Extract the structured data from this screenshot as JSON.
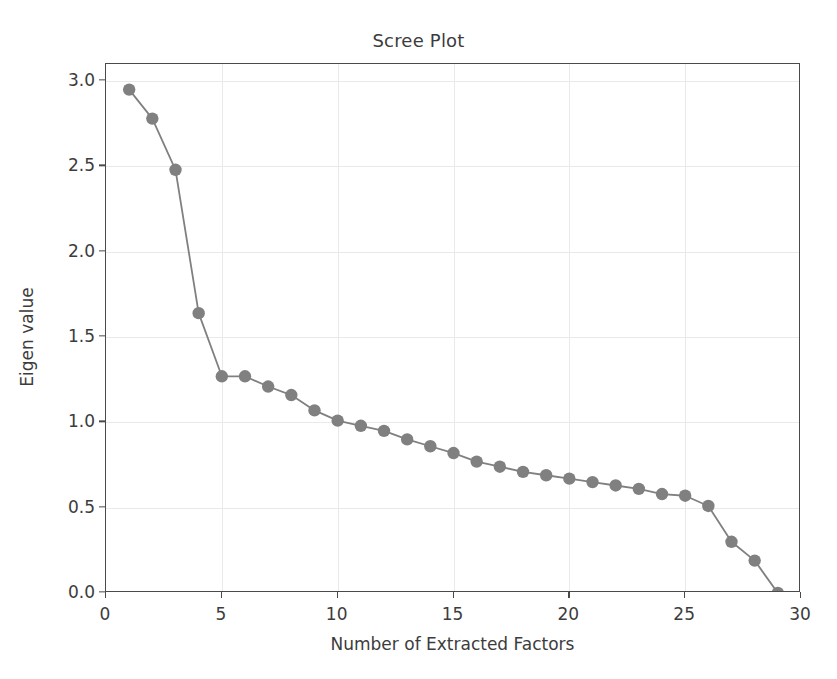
{
  "chart_data": {
    "type": "line",
    "title": "Scree Plot",
    "xlabel": "Number of Extracted Factors",
    "ylabel": "Eigen value",
    "xlim": [
      0,
      30
    ],
    "ylim": [
      0.0,
      3.1
    ],
    "grid": true,
    "legend": "none",
    "marker": "circle",
    "line_color": "#808080",
    "marker_color": "#808080",
    "x": [
      1,
      2,
      3,
      4,
      5,
      6,
      7,
      8,
      9,
      10,
      11,
      12,
      13,
      14,
      15,
      16,
      17,
      18,
      19,
      20,
      21,
      22,
      23,
      24,
      25,
      26,
      27,
      28,
      29
    ],
    "values": [
      2.95,
      2.78,
      2.48,
      1.64,
      1.27,
      1.27,
      1.21,
      1.16,
      1.07,
      1.01,
      0.98,
      0.95,
      0.9,
      0.86,
      0.82,
      0.77,
      0.74,
      0.71,
      0.69,
      0.67,
      0.65,
      0.63,
      0.61,
      0.58,
      0.57,
      0.51,
      0.3,
      0.19,
      0.0
    ],
    "xticks": [
      0,
      5,
      10,
      15,
      20,
      25,
      30
    ],
    "xtick_labels": [
      "0",
      "5",
      "10",
      "15",
      "20",
      "25",
      "30"
    ],
    "yticks": [
      0.0,
      0.5,
      1.0,
      1.5,
      2.0,
      2.5,
      3.0
    ],
    "ytick_labels": [
      "0.0",
      "0.5",
      "1.0",
      "1.5",
      "2.0",
      "2.5",
      "3.0"
    ]
  }
}
